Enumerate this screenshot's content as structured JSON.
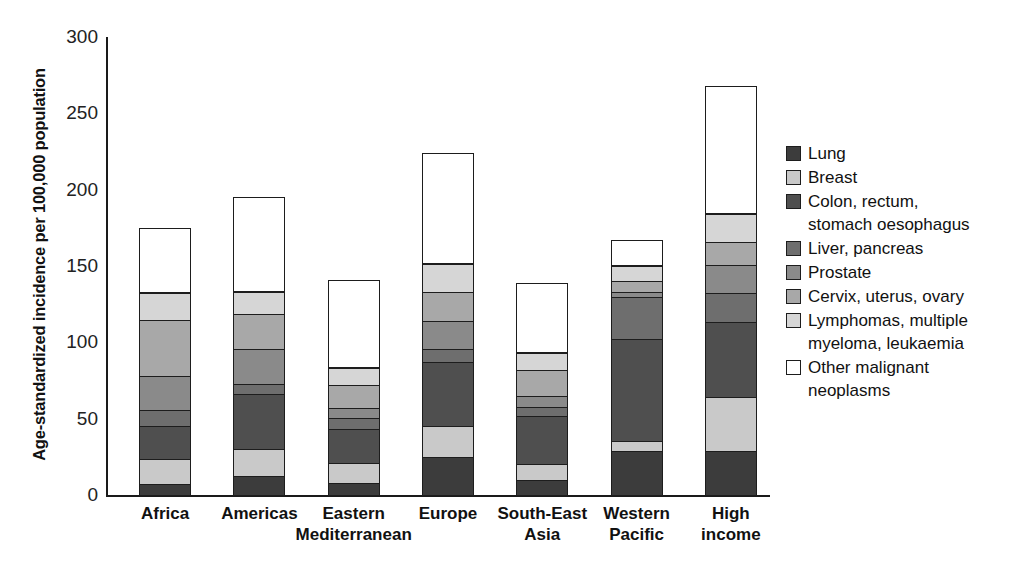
{
  "chart_data": {
    "type": "bar",
    "subtype": "stacked-bar",
    "title": "",
    "xlabel": "",
    "ylabel": "Age-standardized incidence per 100,000 population",
    "ylim": [
      0,
      300
    ],
    "yticks": [
      0,
      50,
      100,
      150,
      200,
      250,
      300
    ],
    "ytick_labels": [
      "0",
      "50",
      "100",
      "150",
      "200",
      "250",
      "300"
    ],
    "grid": false,
    "legend_position": "right",
    "categories": [
      "Africa",
      "Americas",
      "Eastern Mediterranean",
      "Europe",
      "South-East Asia",
      "Western Pacific",
      "High income"
    ],
    "category_lines": [
      [
        "Africa",
        ""
      ],
      [
        "Americas",
        ""
      ],
      [
        "Eastern",
        "Mediterranean"
      ],
      [
        "Europe",
        ""
      ],
      [
        "South-East",
        "Asia"
      ],
      [
        "Western",
        "Pacific"
      ],
      [
        "High",
        "income"
      ]
    ],
    "series": [
      {
        "name": "Lung",
        "color": "#3c3c3c",
        "values": [
          8,
          13,
          9,
          26,
          11,
          30,
          30
        ]
      },
      {
        "name": "Breast",
        "color": "#c9c9c9",
        "values": [
          17,
          19,
          14,
          21,
          11,
          7,
          36
        ]
      },
      {
        "name": "Colon, rectum, stomach oesophagus",
        "color": "#4f4f4f",
        "values": [
          23,
          37,
          23,
          43,
          32,
          68,
          50
        ]
      },
      {
        "name": "Liver, pancreas",
        "color": "#6e6e6e",
        "values": [
          11,
          7,
          8,
          9,
          7,
          28,
          20
        ]
      },
      {
        "name": "Prostate",
        "color": "#8a8a8a",
        "values": [
          23,
          24,
          7,
          19,
          8,
          4,
          19
        ]
      },
      {
        "name": "Cervix, uterus, ovary",
        "color": "#a8a8a8",
        "values": [
          38,
          24,
          16,
          20,
          18,
          8,
          16
        ]
      },
      {
        "name": "Lymphomas, multiple myeloma, leukaemia",
        "color": "#d6d6d6",
        "values": [
          18,
          15,
          12,
          19,
          12,
          11,
          19
        ]
      },
      {
        "name": "Other malignant neoplasms",
        "color": "#ffffff",
        "values": [
          43,
          62,
          58,
          73,
          46,
          17,
          84
        ]
      }
    ],
    "totals": [
      181,
      201,
      147,
      230,
      145,
      173,
      274
    ],
    "legend_entries": [
      {
        "label": "Lung",
        "color": "#3c3c3c"
      },
      {
        "label": "Breast",
        "color": "#c9c9c9"
      },
      {
        "label": "Colon, rectum,\nstomach oesophagus",
        "color": "#4f4f4f"
      },
      {
        "label": "Liver, pancreas",
        "color": "#6e6e6e"
      },
      {
        "label": "Prostate",
        "color": "#8a8a8a"
      },
      {
        "label": "Cervix, uterus, ovary",
        "color": "#a8a8a8"
      },
      {
        "label": "Lymphomas, multiple\nmyeloma, leukaemia",
        "color": "#d6d6d6"
      },
      {
        "label": "Other malignant\nneoplasms",
        "color": "#ffffff"
      }
    ]
  },
  "axis": {
    "y_title": "Age-standardized incidence per 100,000 population"
  }
}
